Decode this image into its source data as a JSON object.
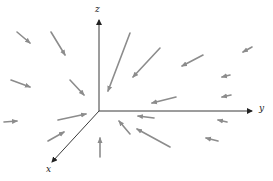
{
  "diagram": {
    "title": "",
    "type": "3D vector field",
    "axes": {
      "z_label": "z",
      "y_label": "y",
      "x_label": "x"
    },
    "colors": {
      "axis": "#3a3a3a",
      "vector": "#8c8c8c",
      "background": "#ffffff"
    },
    "vectors": [
      {
        "x1": 17,
        "y1": 32,
        "x2": 30,
        "y2": 43
      },
      {
        "x1": 51,
        "y1": 32,
        "x2": 65,
        "y2": 55
      },
      {
        "x1": 11,
        "y1": 80,
        "x2": 30,
        "y2": 87
      },
      {
        "x1": 70,
        "y1": 80,
        "x2": 84,
        "y2": 95
      },
      {
        "x1": 130,
        "y1": 33,
        "x2": 108,
        "y2": 91
      },
      {
        "x1": 160,
        "y1": 48,
        "x2": 133,
        "y2": 77
      },
      {
        "x1": 203,
        "y1": 55,
        "x2": 182,
        "y2": 66
      },
      {
        "x1": 252,
        "y1": 47,
        "x2": 243,
        "y2": 52
      },
      {
        "x1": 230,
        "y1": 75,
        "x2": 222,
        "y2": 77
      },
      {
        "x1": 176,
        "y1": 97,
        "x2": 152,
        "y2": 103
      },
      {
        "x1": 231,
        "y1": 95,
        "x2": 222,
        "y2": 97
      },
      {
        "x1": 4,
        "y1": 122,
        "x2": 17,
        "y2": 121
      },
      {
        "x1": 58,
        "y1": 120,
        "x2": 86,
        "y2": 114
      },
      {
        "x1": 48,
        "y1": 141,
        "x2": 64,
        "y2": 132
      },
      {
        "x1": 154,
        "y1": 118,
        "x2": 138,
        "y2": 116
      },
      {
        "x1": 170,
        "y1": 147,
        "x2": 137,
        "y2": 129
      },
      {
        "x1": 130,
        "y1": 134,
        "x2": 119,
        "y2": 121
      },
      {
        "x1": 100,
        "y1": 157,
        "x2": 100,
        "y2": 138
      },
      {
        "x1": 218,
        "y1": 141,
        "x2": 206,
        "y2": 138
      },
      {
        "x1": 227,
        "y1": 122,
        "x2": 218,
        "y2": 120
      }
    ]
  }
}
